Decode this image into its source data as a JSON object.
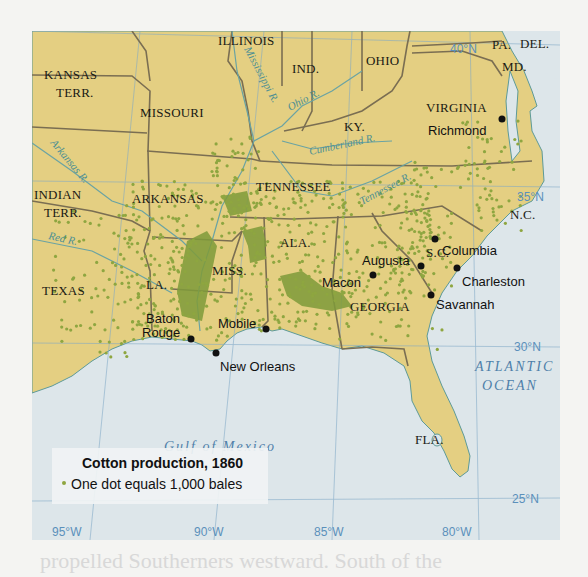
{
  "map": {
    "title": "Cotton production, 1860",
    "legend": {
      "title": "Cotton production, 1860",
      "dot_label": "One dot equals 1,000 bales",
      "dot_color": "#8ea640"
    },
    "colors": {
      "land": "#e4cf82",
      "water": "#dde6ea",
      "border": "#7a6e52",
      "river": "#6aa3a3",
      "cotton_dot": "#8ea640",
      "cotton_dense": "#7f9b3a",
      "graticule": "#7fa8c7"
    },
    "states": [
      {
        "name": "KANSAS",
        "line2": "TERR."
      },
      {
        "name": "MISSOURI"
      },
      {
        "name": "ILLINOIS"
      },
      {
        "name": "IND."
      },
      {
        "name": "OHIO"
      },
      {
        "name": "PA."
      },
      {
        "name": "DEL."
      },
      {
        "name": "MD."
      },
      {
        "name": "VIRGINIA"
      },
      {
        "name": "KY."
      },
      {
        "name": "INDIAN",
        "line2": "TERR."
      },
      {
        "name": "ARKANSAS"
      },
      {
        "name": "TENNESSEE"
      },
      {
        "name": "N.C."
      },
      {
        "name": "S.C."
      },
      {
        "name": "TEXAS"
      },
      {
        "name": "LA."
      },
      {
        "name": "MISS."
      },
      {
        "name": "ALA."
      },
      {
        "name": "GEORGIA"
      },
      {
        "name": "FLA."
      }
    ],
    "cities": [
      {
        "name": "Richmond"
      },
      {
        "name": "Columbia"
      },
      {
        "name": "Augusta"
      },
      {
        "name": "Charleston"
      },
      {
        "name": "Macon"
      },
      {
        "name": "Savannah"
      },
      {
        "name": "Baton",
        "line2": "Rouge"
      },
      {
        "name": "Mobile"
      },
      {
        "name": "New Orleans"
      }
    ],
    "rivers": [
      "Mississippi R.",
      "Ohio R.",
      "Cumberland R.",
      "Tennessee R.",
      "Arkansas R.",
      "Red R."
    ],
    "water_bodies": [
      {
        "name": "Gulf of Mexico"
      },
      {
        "name": "ATLANTIC",
        "line2": "OCEAN"
      }
    ],
    "latitudes": [
      "40°N",
      "35°N",
      "30°N",
      "25°N"
    ],
    "longitudes": [
      "95°W",
      "90°W",
      "85°W",
      "80°W"
    ]
  },
  "below_text": "propelled Southerners westward. South of the"
}
